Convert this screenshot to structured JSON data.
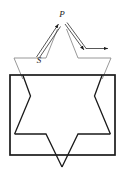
{
  "figure": {
    "kind": "geometry-diagram",
    "background_color": "#ffffff",
    "stroke_color_dark": "#1a1a1a",
    "stroke_color_light": "#8c8c8c",
    "labels": [
      {
        "id": "apex",
        "text": "P",
        "x": 62,
        "y": 16
      },
      {
        "id": "source",
        "text": "S",
        "x": 39,
        "y": 62
      }
    ],
    "rays": [
      {
        "id": "ray-up-left",
        "description": "arrow from S up-right to P",
        "from_x": 36,
        "from_y": 56,
        "to_x": 60,
        "to_y": 22,
        "arrow_at": "end"
      },
      {
        "id": "ray-down-right",
        "description": "arrow from P down-right toward base",
        "from_x": 64,
        "from_y": 22,
        "to_x": 84,
        "to_y": 50,
        "arrow_at": "end"
      },
      {
        "id": "ray-horizontal",
        "description": "horizontal arrow pointing right",
        "from_x": 86,
        "from_y": 49,
        "to_x": 110,
        "to_y": 49,
        "arrow_at": "end"
      }
    ],
    "rectangle": {
      "id": "outer-rectangle",
      "x": 10,
      "y": 75,
      "width": 105,
      "height": 80,
      "stroke_width": 1.6
    },
    "star": {
      "id": "six-pointed-star",
      "points_count": 6,
      "outline": [
        [
          62,
          18
        ],
        [
          78,
          58
        ],
        [
          111,
          58
        ],
        [
          95,
          96
        ],
        [
          111,
          134
        ],
        [
          78,
          134
        ],
        [
          62,
          168
        ],
        [
          46,
          134
        ],
        [
          14,
          134
        ],
        [
          30,
          96
        ],
        [
          14,
          58
        ],
        [
          46,
          58
        ]
      ]
    }
  }
}
